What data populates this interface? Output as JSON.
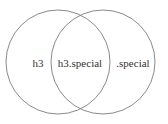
{
  "diagram": {
    "type": "venn",
    "sets": [
      {
        "name": "h3"
      },
      {
        "name": ".special"
      }
    ],
    "regions": {
      "left_only": "h3",
      "intersection": "h3.special",
      "right_only": ".special"
    },
    "stroke_color": "#8a8a8a",
    "text_color": "#333333"
  }
}
